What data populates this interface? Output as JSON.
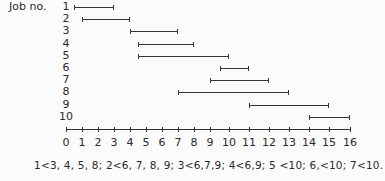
{
  "title_label": "Job no.",
  "chart_data": {
    "type": "gantt",
    "title": "",
    "ylabel": "Job no.",
    "xlabel": "",
    "x_ticks": [
      0,
      1,
      2,
      3,
      4,
      5,
      6,
      7,
      8,
      9,
      10,
      11,
      12,
      13,
      14,
      15,
      16
    ],
    "xlim": [
      0,
      16
    ],
    "grid": false,
    "jobs": [
      {
        "job": "1",
        "start": 0.5,
        "end": 3
      },
      {
        "job": "2",
        "start": 1,
        "end": 4
      },
      {
        "job": "3",
        "start": 4,
        "end": 7
      },
      {
        "job": "4",
        "start": 4.5,
        "end": 8
      },
      {
        "job": "5",
        "start": 4.5,
        "end": 10
      },
      {
        "job": "6",
        "start": 9.5,
        "end": 11
      },
      {
        "job": "7",
        "start": 9,
        "end": 12
      },
      {
        "job": "8",
        "start": 7,
        "end": 13
      },
      {
        "job": "9",
        "start": 11,
        "end": 15
      },
      {
        "job": "10",
        "start": 14,
        "end": 16
      }
    ],
    "annotation": "1<3, 4, 5, 8;  2<6, 7, 8, 9;  3<6,7,9;  4<6,9;  5 <10;  6,<10;  7<10."
  },
  "tick_px": [
    66,
    82,
    98,
    114,
    130,
    146,
    162,
    178,
    194,
    210,
    229,
    249,
    269,
    289,
    309,
    329,
    350
  ],
  "precedence_text": "1<3, 4, 5, 8;  2<6, 7, 8, 9;  3<6,7,9;  4<6,9;  5 <10;  6,<10;  7<10."
}
